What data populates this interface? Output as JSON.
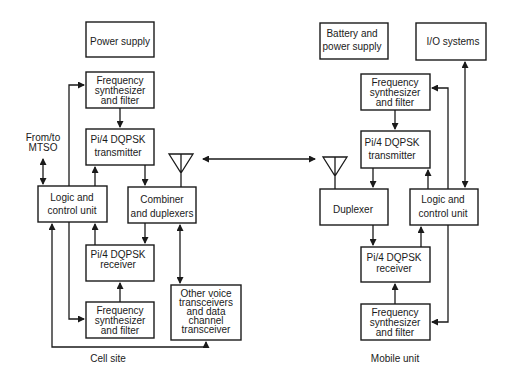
{
  "diagram": {
    "cell_site": {
      "caption": "Cell site",
      "external_label": [
        "From/to",
        "MTSO"
      ],
      "blocks": {
        "power_supply": [
          "Power supply"
        ],
        "freq_synth_tx": [
          "Frequency",
          "synthesizer",
          "and filter"
        ],
        "transmitter": [
          "Pi/4 DQPSK",
          "transmitter"
        ],
        "logic": [
          "Logic and",
          "control unit"
        ],
        "combiner": [
          "Combiner",
          "and duplexers"
        ],
        "receiver": [
          "Pi/4 DQPSK",
          "receiver"
        ],
        "freq_synth_rx": [
          "Frequency",
          "synthesizer",
          "and filter"
        ],
        "other": [
          "Other voice",
          "transceivers",
          "and data",
          "channel",
          "transceiver"
        ]
      }
    },
    "mobile_unit": {
      "caption": "Mobile unit",
      "blocks": {
        "battery": [
          "Battery and",
          "power supply"
        ],
        "io": [
          "I/O systems"
        ],
        "freq_synth_tx": [
          "Frequency",
          "synthesizer",
          "and filter"
        ],
        "transmitter": [
          "Pi/4 DQPSK",
          "transmitter"
        ],
        "duplexer": [
          "Duplexer"
        ],
        "logic": [
          "Logic and",
          "control unit"
        ],
        "receiver": [
          "Pi/4 DQPSK",
          "receiver"
        ],
        "freq_synth_rx": [
          "Frequency",
          "synthesizer",
          "and filter"
        ]
      }
    },
    "link": "bidirectional radio link between antennas"
  }
}
